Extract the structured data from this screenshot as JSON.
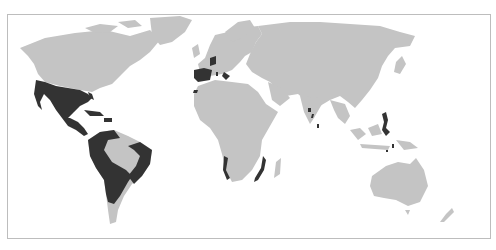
{
  "map": {
    "type": "world-map",
    "projection": "equirectangular-like",
    "colors": {
      "background": "#ffffff",
      "land": "#c4c4c4",
      "highlight": "#333333",
      "frame": "#bdbdbd"
    },
    "highlighted_regions": [
      "Spain",
      "Spanish Netherlands",
      "Southern Italy (Naples)",
      "Sicily",
      "Sardinia",
      "Canary Islands",
      "Mexico and southwestern North America",
      "Florida",
      "Central America",
      "Caribbean islands (Cuba, Hispaniola, Puerto Rico)",
      "Western and southern South America",
      "Eastern Brazil coast",
      "Angola coast",
      "Mozambique coast",
      "Western India coast (Goa)",
      "Ceylon",
      "Philippines",
      "Moluccas"
    ]
  }
}
